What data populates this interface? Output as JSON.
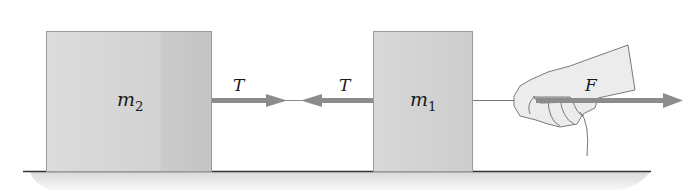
{
  "diagram": {
    "blocks": [
      {
        "id": "m2",
        "label_main": "m",
        "label_sub": "2"
      },
      {
        "id": "m1",
        "label_main": "m",
        "label_sub": "1"
      }
    ],
    "forces": [
      {
        "id": "tension-right-on-rope",
        "label": "T",
        "direction": "right"
      },
      {
        "id": "tension-left-on-rope",
        "label": "T",
        "direction": "left"
      },
      {
        "id": "applied-force",
        "label": "F",
        "direction": "right"
      }
    ],
    "colors": {
      "block_fill": "#d4d4d4",
      "block_edge": "#9a9a9a",
      "arrow": "#8c8c8c",
      "ground_line": "#333333",
      "ground_shadow": "#e6e6e6",
      "hand_fill": "#ececec",
      "hand_stroke": "#7a7a7a"
    }
  }
}
